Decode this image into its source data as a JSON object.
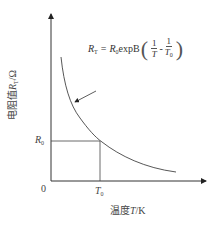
{
  "diagram": {
    "type": "resistance-temperature characteristic curve (NTC thermistor)",
    "formula": {
      "lhs": "R",
      "lhs_sub": "T",
      "equals": "=",
      "rhs_prefix": "R",
      "rhs_prefix_sub": "0",
      "rhs_func": "expB",
      "frac1_num": "1",
      "frac1_den": "T",
      "minus": "-",
      "frac2_num": "1",
      "frac2_den": "T",
      "frac2_den_sub": "0"
    },
    "y_axis": {
      "label_prefix": "电阻值",
      "label_var": "R",
      "label_var_sub": "T",
      "label_unit": "/Ω"
    },
    "x_axis": {
      "label_prefix": "温度",
      "label_var": "T",
      "label_unit": "/K"
    },
    "origin_label": "0",
    "r0_label": "R",
    "r0_label_sub": "0",
    "t0_label": "T",
    "t0_label_sub": "0",
    "colors": {
      "axis": "#333333",
      "curve": "#444444",
      "text": "#444444",
      "background": "#ffffff"
    }
  }
}
